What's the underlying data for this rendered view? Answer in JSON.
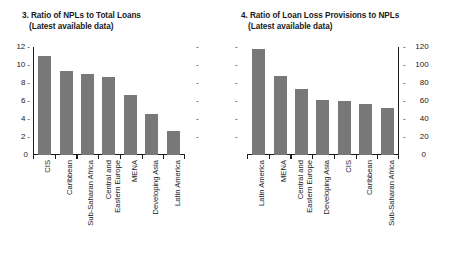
{
  "chart_data": [
    {
      "type": "bar",
      "panel_number": "3.",
      "title": "3. Ratio of NPLs to Total Loans",
      "subtitle": "(Latest available data)",
      "title_line1": "3. Ratio of NPLs to Total Loans",
      "title_line2": "(Latest available data)",
      "xlabel": "",
      "ylabel": "",
      "ylim": [
        0,
        12
      ],
      "ytick_values": [
        0,
        2,
        4,
        6,
        8,
        10,
        12
      ],
      "ytick_labels": [
        "0",
        "2",
        "4",
        "6",
        "8",
        "10",
        "12"
      ],
      "axis_side": "left",
      "mirror_ticks": true,
      "grid": false,
      "legend": "none",
      "bar_color": "#787878",
      "categories": [
        "CIS",
        "Caribbean",
        "Sub-Saharan Africa",
        "Central and Eastern Europe",
        "Developing Asia",
        "MENA",
        "Latin America"
      ],
      "category_lines": [
        [
          "CIS"
        ],
        [
          "Caribbean"
        ],
        [
          "Sub-Saharan Africa"
        ],
        [
          "Central and",
          "Eastern Europe"
        ],
        [
          "MENA"
        ],
        [
          "Developing Asia"
        ],
        [
          "Latin America"
        ]
      ],
      "categories_ordered": [
        "CIS",
        "Caribbean",
        "Sub-Saharan Africa",
        "Central and Eastern Europe",
        "MENA",
        "Developing Asia",
        "Latin America"
      ],
      "values": [
        11.0,
        9.3,
        9.0,
        8.7,
        6.7,
        4.6,
        2.7
      ]
    },
    {
      "type": "bar",
      "panel_number": "4.",
      "title": "4. Ratio of Loan Loss Provisions to NPLs",
      "subtitle": "(Latest available data)",
      "title_line1": "4. Ratio of Loan Loss Provisions to NPLs",
      "title_line2": "(Latest available data)",
      "xlabel": "",
      "ylabel": "",
      "ylim": [
        0,
        120
      ],
      "ytick_values": [
        0,
        20,
        40,
        60,
        80,
        100,
        120
      ],
      "ytick_labels": [
        "0",
        "20",
        "40",
        "60",
        "80",
        "100",
        "120"
      ],
      "axis_side": "right",
      "mirror_ticks": true,
      "grid": false,
      "legend": "none",
      "bar_color": "#787878",
      "categories": [
        "Latin America",
        "MENA",
        "Central and Eastern Europe",
        "Developing Asia",
        "CIS",
        "Caribbean",
        "Sub-Saharan Africa"
      ],
      "category_lines": [
        [
          "Latin America"
        ],
        [
          "MENA"
        ],
        [
          "Central and",
          "Eastern Europe"
        ],
        [
          "Developing Asia"
        ],
        [
          "CIS"
        ],
        [
          "Caribbean"
        ],
        [
          "Sub-Saharan Africa"
        ]
      ],
      "values": [
        118,
        88,
        73,
        61,
        60,
        57,
        52
      ]
    }
  ]
}
